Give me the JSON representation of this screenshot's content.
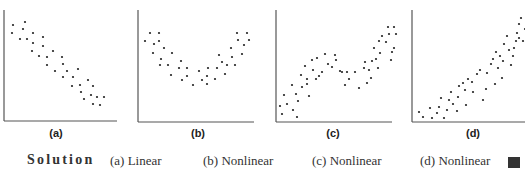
{
  "panels": [
    {
      "label": "(a)",
      "answer": "(a) Linear"
    },
    {
      "label": "(b)",
      "answer": "(b) Nonlinear"
    },
    {
      "label": "(c)",
      "answer": "(c) Nonlinear"
    },
    {
      "label": "(d)",
      "answer": "(d) Nonlinear"
    }
  ],
  "solution": {
    "heading": "Solution"
  },
  "chart_data": [
    {
      "type": "scatter",
      "title": "(a)",
      "xlabel": "",
      "ylabel": "",
      "grid": false,
      "description": "Negative linear relationship",
      "points": [
        [
          13,
          25
        ],
        [
          25,
          22
        ],
        [
          12,
          33
        ],
        [
          23,
          29
        ],
        [
          20,
          39
        ],
        [
          27,
          39
        ],
        [
          33,
          33
        ],
        [
          43,
          37
        ],
        [
          33,
          43
        ],
        [
          43,
          46
        ],
        [
          32,
          51
        ],
        [
          39,
          56
        ],
        [
          53,
          51
        ],
        [
          47,
          57
        ],
        [
          62,
          57
        ],
        [
          47,
          65
        ],
        [
          63,
          64
        ],
        [
          55,
          71
        ],
        [
          67,
          71
        ],
        [
          78,
          69
        ],
        [
          63,
          77
        ],
        [
          73,
          77
        ],
        [
          88,
          80
        ],
        [
          80,
          85
        ],
        [
          93,
          86
        ],
        [
          72,
          86
        ],
        [
          81,
          92
        ],
        [
          91,
          95
        ],
        [
          97,
          97
        ],
        [
          84,
          99
        ],
        [
          93,
          104
        ],
        [
          104,
          97
        ],
        [
          100,
          105
        ]
      ]
    },
    {
      "type": "scatter",
      "title": "(b)",
      "xlabel": "",
      "ylabel": "",
      "grid": false,
      "description": "U-shaped (quadratic) nonlinear relationship",
      "points": [
        [
          25,
          33
        ],
        [
          34,
          33
        ],
        [
          20,
          41
        ],
        [
          29,
          44
        ],
        [
          34,
          41
        ],
        [
          28,
          53
        ],
        [
          39,
          48
        ],
        [
          47,
          53
        ],
        [
          36,
          59
        ],
        [
          43,
          65
        ],
        [
          56,
          61
        ],
        [
          54,
          68
        ],
        [
          62,
          68
        ],
        [
          35,
          65
        ],
        [
          46,
          75
        ],
        [
          57,
          80
        ],
        [
          62,
          76
        ],
        [
          68,
          85
        ],
        [
          74,
          71
        ],
        [
          77,
          80
        ],
        [
          82,
          76
        ],
        [
          83,
          68
        ],
        [
          82,
          84
        ],
        [
          90,
          79
        ],
        [
          92,
          68
        ],
        [
          97,
          62
        ],
        [
          94,
          55
        ],
        [
          100,
          74
        ],
        [
          102,
          65
        ],
        [
          106,
          48
        ],
        [
          107,
          57
        ],
        [
          110,
          65
        ],
        [
          113,
          40
        ],
        [
          112,
          33
        ],
        [
          122,
          33
        ],
        [
          119,
          45
        ],
        [
          117,
          54
        ],
        [
          124,
          40
        ]
      ]
    },
    {
      "type": "scatter",
      "title": "(c)",
      "xlabel": "",
      "ylabel": "",
      "grid": false,
      "description": "Cubic / S-shaped nonlinear relationship",
      "points": [
        [
          25,
          106
        ],
        [
          27,
          114
        ],
        [
          29,
          95
        ],
        [
          32,
          104
        ],
        [
          37,
          85
        ],
        [
          38,
          110
        ],
        [
          42,
          117
        ],
        [
          41,
          94
        ],
        [
          43,
          101
        ],
        [
          46,
          75
        ],
        [
          47,
          87
        ],
        [
          50,
          66
        ],
        [
          52,
          79
        ],
        [
          52,
          84
        ],
        [
          54,
          96
        ],
        [
          57,
          60
        ],
        [
          58,
          70
        ],
        [
          61,
          79
        ],
        [
          62,
          58
        ],
        [
          64,
          76
        ],
        [
          67,
          72
        ],
        [
          70,
          54
        ],
        [
          73,
          64
        ],
        [
          77,
          67
        ],
        [
          80,
          55
        ],
        [
          81,
          60
        ],
        [
          85,
          71
        ],
        [
          87,
          72
        ],
        [
          90,
          85
        ],
        [
          92,
          72
        ],
        [
          94,
          79
        ],
        [
          100,
          72
        ],
        [
          104,
          88
        ],
        [
          109,
          68
        ],
        [
          110,
          62
        ],
        [
          112,
          83
        ],
        [
          114,
          70
        ],
        [
          116,
          78
        ],
        [
          117,
          61
        ],
        [
          119,
          48
        ],
        [
          121,
          59
        ],
        [
          123,
          68
        ],
        [
          124,
          41
        ],
        [
          125,
          53
        ],
        [
          127,
          36
        ],
        [
          131,
          42
        ],
        [
          133,
          27
        ],
        [
          134,
          34
        ],
        [
          136,
          60
        ],
        [
          137,
          52
        ],
        [
          139,
          27
        ],
        [
          139,
          48
        ],
        [
          141,
          34
        ]
      ]
    },
    {
      "type": "scatter",
      "title": "(d)",
      "xlabel": "",
      "ylabel": "",
      "grid": false,
      "description": "Exponential-like increasing nonlinear relationship",
      "points": [
        [
          34,
          112
        ],
        [
          38,
          117
        ],
        [
          45,
          108
        ],
        [
          47,
          118
        ],
        [
          52,
          113
        ],
        [
          54,
          107
        ],
        [
          56,
          98
        ],
        [
          59,
          118
        ],
        [
          62,
          110
        ],
        [
          64,
          100
        ],
        [
          66,
          92
        ],
        [
          68,
          104
        ],
        [
          72,
          111
        ],
        [
          73,
          97
        ],
        [
          74,
          86
        ],
        [
          78,
          83
        ],
        [
          80,
          90
        ],
        [
          81,
          105
        ],
        [
          83,
          79
        ],
        [
          87,
          82
        ],
        [
          88,
          92
        ],
        [
          92,
          74
        ],
        [
          95,
          70
        ],
        [
          98,
          100
        ],
        [
          101,
          89
        ],
        [
          102,
          73
        ],
        [
          106,
          64
        ],
        [
          108,
          59
        ],
        [
          110,
          84
        ],
        [
          111,
          52
        ],
        [
          113,
          68
        ],
        [
          115,
          56
        ],
        [
          117,
          78
        ],
        [
          118,
          61
        ],
        [
          119,
          44
        ],
        [
          122,
          36
        ],
        [
          124,
          50
        ],
        [
          126,
          65
        ],
        [
          128,
          56
        ],
        [
          129,
          48
        ],
        [
          131,
          41
        ],
        [
          132,
          33
        ],
        [
          134,
          24
        ],
        [
          134,
          38
        ],
        [
          136,
          18
        ],
        [
          138,
          41
        ],
        [
          140,
          29
        ],
        [
          142,
          43
        ],
        [
          144,
          22
        ],
        [
          145,
          36
        ],
        [
          146,
          20
        ],
        [
          148,
          27
        ]
      ]
    }
  ]
}
